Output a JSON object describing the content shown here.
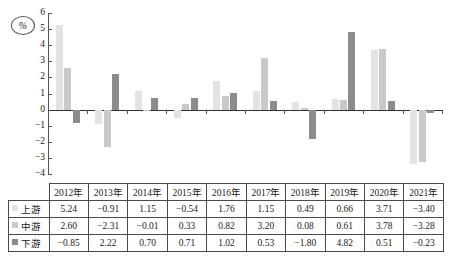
{
  "chart_data": {
    "type": "bar",
    "title": "",
    "xlabel": "",
    "ylabel": "%",
    "unit_label": "%",
    "ylim": [
      -4,
      6
    ],
    "ytick_step": 1,
    "yticks": [
      "6",
      "5",
      "4",
      "3",
      "2",
      "1",
      "0",
      "−1",
      "−2",
      "−3",
      "−4"
    ],
    "grid": false,
    "legend_position": "table-row-labels",
    "categories": [
      "2012年",
      "2013年",
      "2014年",
      "2015年",
      "2016年",
      "2017年",
      "2018年",
      "2019年",
      "2020年",
      "2021年"
    ],
    "series": [
      {
        "name": "上游",
        "color": "#e3e3e3",
        "values": [
          5.24,
          -0.91,
          1.15,
          -0.54,
          1.76,
          1.15,
          0.49,
          0.66,
          3.71,
          -3.4
        ],
        "labels": [
          "5.24",
          "−0.91",
          "1.15",
          "−0.54",
          "1.76",
          "1.15",
          "0.49",
          "0.66",
          "3.71",
          "−3.40"
        ]
      },
      {
        "name": "中游",
        "color": "#c9c9c9",
        "values": [
          2.6,
          -2.31,
          -0.01,
          0.33,
          0.82,
          3.2,
          0.08,
          0.61,
          3.78,
          -3.28
        ],
        "labels": [
          "2.60",
          "−2.31",
          "−0.01",
          "0.33",
          "0.82",
          "3.20",
          "0.08",
          "0.61",
          "3.78",
          "−3.28"
        ]
      },
      {
        "name": "下游",
        "color": "#8c8c8c",
        "values": [
          -0.85,
          2.22,
          0.7,
          0.71,
          1.02,
          0.53,
          -1.8,
          4.82,
          0.51,
          -0.23
        ],
        "labels": [
          "−0.85",
          "2.22",
          "0.70",
          "0.71",
          "1.02",
          "0.53",
          "−1.80",
          "4.82",
          "0.51",
          "−0.23"
        ]
      }
    ]
  },
  "table": {
    "corner": "",
    "header": [
      "2012年",
      "2013年",
      "2014年",
      "2015年",
      "2016年",
      "2017年",
      "2018年",
      "2019年",
      "2020年",
      "2021年"
    ],
    "rows": [
      {
        "label": "上游",
        "swatch": "#e3e3e3",
        "cells": [
          "5.24",
          "−0.91",
          "1.15",
          "−0.54",
          "1.76",
          "1.15",
          "0.49",
          "0.66",
          "3.71",
          "−3.40"
        ]
      },
      {
        "label": "中游",
        "swatch": "#c9c9c9",
        "cells": [
          "2.60",
          "−2.31",
          "−0.01",
          "0.33",
          "0.82",
          "3.20",
          "0.08",
          "0.61",
          "3.78",
          "−3.28"
        ]
      },
      {
        "label": "下游",
        "swatch": "#8c8c8c",
        "cells": [
          "−0.85",
          "2.22",
          "0.70",
          "0.71",
          "1.02",
          "0.53",
          "−1.80",
          "4.82",
          "0.51",
          "−0.23"
        ]
      }
    ]
  }
}
